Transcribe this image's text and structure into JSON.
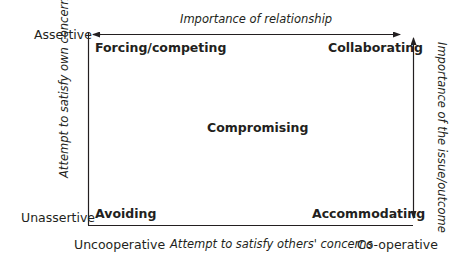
{
  "diagram": {
    "type": "conflict-modes-grid",
    "top_axis_label": "Importance of relationship",
    "left_axis_label": "Attempt to satisfy own concerns",
    "right_axis_label": "Importance of the issue/outcome",
    "bottom_axis_label": "Attempt to satisfy others' concerns",
    "y_high": "Assertive",
    "y_low": "Unassertive",
    "x_low": "Uncooperative",
    "x_high": "Co-operative",
    "quadrants": {
      "top_left": "Forcing/competing",
      "top_right": "Collaborating",
      "center": "Compromising",
      "bottom_left": "Avoiding",
      "bottom_right": "Accommodating"
    },
    "colors": {
      "ink": "#231f20",
      "background": "#ffffff"
    }
  }
}
